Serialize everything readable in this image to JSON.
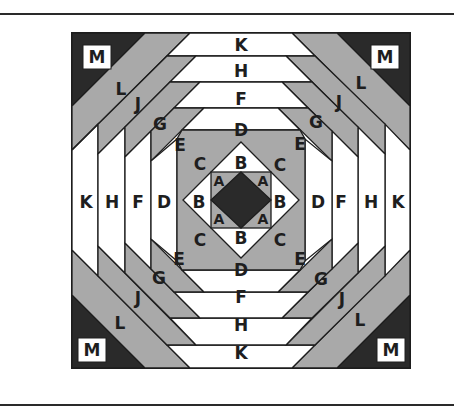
{
  "figure": {
    "type": "quilt-block-piecing-diagram",
    "colors": {
      "dark": "#2a2a2a",
      "gray": "#a9a9a9",
      "light": "#ffffff",
      "outline": "#1e1e1e"
    },
    "corner_label": "M",
    "top_column_labels": [
      "K",
      "H",
      "F",
      "D",
      "B"
    ],
    "bottom_column_labels": [
      "B",
      "D",
      "F",
      "H",
      "K"
    ],
    "left_row_labels": [
      "K",
      "H",
      "F",
      "D",
      "B"
    ],
    "right_row_labels": [
      "B",
      "D",
      "F",
      "H",
      "K"
    ],
    "diagonal_labels_top_left": [
      "L",
      "J",
      "G",
      "E",
      "C"
    ],
    "diagonal_labels_top_right": [
      "L",
      "J",
      "G",
      "E",
      "C"
    ],
    "diagonal_labels_bottom_left": [
      "C",
      "E",
      "G",
      "J",
      "L"
    ],
    "diagonal_labels_bottom_right": [
      "C",
      "E",
      "G",
      "J",
      "L"
    ],
    "center_labels": [
      "A",
      "A",
      "A",
      "A"
    ],
    "labels": {
      "m": "M",
      "l": "L",
      "k": "K",
      "j": "J",
      "h": "H",
      "g": "G",
      "f": "F",
      "e": "E",
      "d": "D",
      "c": "C",
      "b": "B",
      "a": "A"
    }
  }
}
